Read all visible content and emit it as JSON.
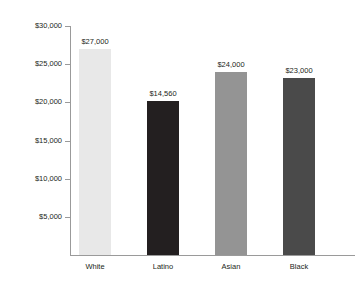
{
  "chart": {
    "title": "",
    "axis": {
      "y_tick_labels": [
        "$30,000",
        "$25,000",
        "$20,000",
        "$15,000",
        "$10,000",
        "$5,000"
      ]
    }
  },
  "chart_data": {
    "type": "bar",
    "title": "",
    "xlabel": "",
    "ylabel": "",
    "ylim": [
      0,
      30000
    ],
    "grid": false,
    "legend": false,
    "categories": [
      "White",
      "Latino",
      "Asian",
      "Black"
    ],
    "values": [
      27000,
      14560,
      24000,
      23000
    ],
    "value_labels": [
      "$27,000",
      "$14,560",
      "$24,000",
      "$23,000"
    ],
    "drawn_values": [
      27000,
      20200,
      24000,
      23200
    ],
    "tick_values": [
      30000,
      25000,
      20000,
      15000,
      10000,
      5000
    ],
    "tick_labels": [
      "$30,000",
      "$25,000",
      "$20,000",
      "$15,000",
      "$10,000",
      "$5,000"
    ],
    "bar_colors": [
      "#e8e8e8",
      "#231f20",
      "#949494",
      "#4a4a4a"
    ]
  }
}
